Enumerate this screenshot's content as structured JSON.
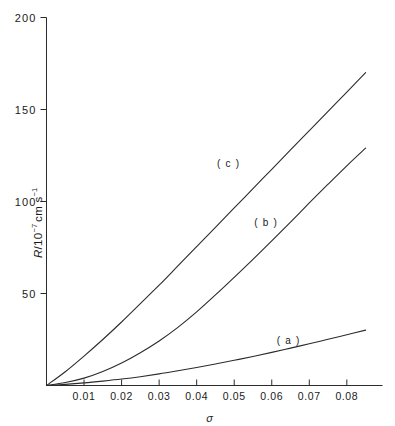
{
  "chart_data": {
    "type": "line",
    "title": "",
    "xlabel": "σ",
    "ylabel": "R/10⁻⁷ cm s⁻¹",
    "ylabel_parts": {
      "symbol": "R",
      "slash": "/",
      "mantissa": "10",
      "exponent": "−7",
      "units": "cm s",
      "units_exponent": "−1"
    },
    "xlim": [
      0,
      0.0895
    ],
    "ylim": [
      0,
      200
    ],
    "grid": false,
    "legend": "inline-curve-labels",
    "xticks": [
      0.01,
      0.02,
      0.03,
      0.04,
      0.05,
      0.06,
      0.07,
      0.08
    ],
    "xtick_labels": [
      "0.01",
      "0.02",
      "0.03",
      "0.04",
      "0.05",
      "0.06",
      "0.07",
      "0.08"
    ],
    "yticks": [
      50,
      100,
      150,
      200
    ],
    "ytick_labels": [
      "50",
      "100",
      "150",
      "200"
    ],
    "series": [
      {
        "name": "(a)",
        "label": "( a )",
        "label_x": 0.0645,
        "label_y": 22.5,
        "x": [
          0,
          0.005,
          0.01,
          0.015,
          0.02,
          0.025,
          0.03,
          0.035,
          0.04,
          0.045,
          0.05,
          0.055,
          0.06,
          0.065,
          0.07,
          0.075,
          0.08,
          0.085,
          0.09
        ],
        "y": [
          0,
          0.6,
          1.4,
          2.4,
          3.5,
          4.8,
          6.3,
          8.0,
          9.8,
          11.7,
          13.7,
          15.8,
          18.0,
          20.3,
          22.7,
          25.1,
          27.6,
          30.1,
          32.6
        ]
      },
      {
        "name": "(b)",
        "label": "( b )",
        "label_x": 0.0585,
        "label_y": 86.5,
        "x": [
          0,
          0.005,
          0.01,
          0.015,
          0.02,
          0.025,
          0.03,
          0.035,
          0.04,
          0.045,
          0.05,
          0.055,
          0.06,
          0.065,
          0.07,
          0.075,
          0.08,
          0.085,
          0.09
        ],
        "y": [
          0,
          1.6,
          4.0,
          7.6,
          12.2,
          17.8,
          24.2,
          31.6,
          40.0,
          49.2,
          58.8,
          68.6,
          78.6,
          88.8,
          99.2,
          109.4,
          119.4,
          129.0,
          137.0
        ]
      },
      {
        "name": "(c)",
        "label": "( c )",
        "label_x": 0.0485,
        "label_y": 118.5,
        "x": [
          0,
          0.005,
          0.01,
          0.015,
          0.02,
          0.025,
          0.03,
          0.035,
          0.04,
          0.045,
          0.05,
          0.055,
          0.06,
          0.065,
          0.07,
          0.075,
          0.08,
          0.085,
          0.09
        ],
        "y": [
          0,
          7.5,
          16.0,
          25.0,
          34.5,
          44.5,
          54.5,
          65.0,
          75.5,
          86.0,
          96.5,
          107.0,
          117.5,
          128.0,
          138.5,
          149.0,
          159.5,
          170.0,
          180.5
        ]
      }
    ]
  }
}
